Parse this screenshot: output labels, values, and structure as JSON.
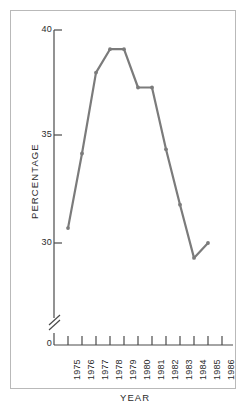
{
  "chart_data": {
    "type": "line",
    "title": "",
    "xlabel": "YEAR",
    "ylabel": "PERCENTAGE",
    "x": [
      1975,
      1976,
      1977,
      1978,
      1979,
      1980,
      1981,
      1982,
      1983,
      1984,
      1985
    ],
    "values": [
      30.7,
      34.2,
      38.0,
      39.1,
      39.1,
      37.3,
      37.3,
      34.4,
      31.8,
      29.3,
      30.0
    ],
    "series": [
      {
        "name": "Percentage",
        "values": [
          30.7,
          34.2,
          38.0,
          39.1,
          39.1,
          37.3,
          37.3,
          34.4,
          31.8,
          29.3,
          30.0
        ]
      }
    ],
    "x_tick_labels": [
      "1975",
      "1976",
      "1977",
      "1978",
      "1979",
      "1980",
      "1981",
      "1982",
      "1983",
      "1984",
      "1985",
      "1986"
    ],
    "y_tick_labels": [
      "0",
      "30",
      "35",
      "40"
    ],
    "ylim": [
      29.0,
      40.0
    ],
    "y_axis_break": true,
    "y_axis_break_label": "0",
    "grid": false,
    "legend": false,
    "legend_position": "none",
    "line_color": "#7b7b7b",
    "marker": "dot",
    "frame_color": "#b9b9b9",
    "text_color": "#2b2b2b"
  },
  "axes": {
    "y_title": "PERCENTAGE",
    "x_title": "YEAR",
    "y_ticks": [
      {
        "label": "40",
        "value": 40
      },
      {
        "label": "35",
        "value": 35
      },
      {
        "label": "30",
        "value": 30
      },
      {
        "label": "0",
        "value": 0
      }
    ],
    "x_ticks": [
      {
        "label": "1975"
      },
      {
        "label": "1976"
      },
      {
        "label": "1977"
      },
      {
        "label": "1978"
      },
      {
        "label": "1979"
      },
      {
        "label": "1980"
      },
      {
        "label": "1981"
      },
      {
        "label": "1982"
      },
      {
        "label": "1983"
      },
      {
        "label": "1984"
      },
      {
        "label": "1985"
      },
      {
        "label": "1986"
      }
    ]
  }
}
